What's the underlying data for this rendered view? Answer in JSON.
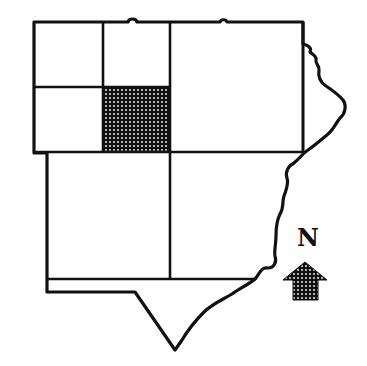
{
  "map": {
    "title": "",
    "regions": [
      {
        "id": "nw-top-left",
        "highlighted": false
      },
      {
        "id": "nw-top-right",
        "highlighted": false
      },
      {
        "id": "nw-bottom-left",
        "highlighted": false
      },
      {
        "id": "nw-bottom-right",
        "highlighted": true
      },
      {
        "id": "ne",
        "highlighted": false
      },
      {
        "id": "sw",
        "highlighted": false
      },
      {
        "id": "se",
        "highlighted": false
      },
      {
        "id": "south-point",
        "highlighted": false
      }
    ],
    "highlight_pattern": "dotted",
    "colors": {
      "line": "#111111",
      "fill": "#ffffff",
      "highlight": "#1a1a1a"
    }
  },
  "compass": {
    "label": "N",
    "icon": "north-arrow-icon"
  }
}
